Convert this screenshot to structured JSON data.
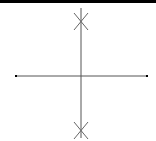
{
  "diagram": {
    "type": "pole-zero-plot",
    "real_axis_label": "Real axis",
    "imag_axis_label": "Imaginary axis",
    "colors": {
      "topbar": "#000000",
      "axis": "#555555",
      "marker": "#666666",
      "endpoint": "#000000",
      "background": "#ffffff"
    },
    "origin_px": [
      81,
      76
    ],
    "real_axis_px": {
      "x1": 16,
      "x2": 147,
      "y": 76
    },
    "imag_axis_px": {
      "x": 81,
      "y1": 8,
      "y2": 138
    },
    "poles": [
      {
        "label": "pole-upper",
        "px": [
          81,
          21
        ],
        "marker": "x"
      },
      {
        "label": "pole-lower",
        "px": [
          81,
          130
        ],
        "marker": "x"
      }
    ]
  }
}
